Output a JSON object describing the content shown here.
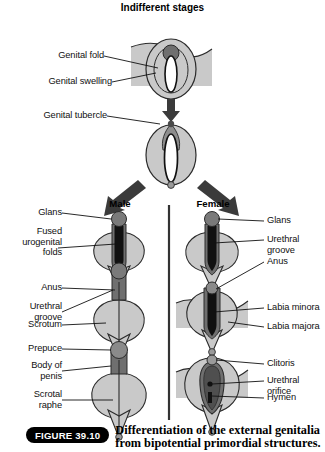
{
  "figure": {
    "title": "Indifferent\nstages",
    "badge": "FIGURE 39.10",
    "caption_line1": "Differentiation of the external genitalia",
    "caption_line2": "from bipotential primordial structures."
  },
  "columns": {
    "male_heading": "Male",
    "female_heading": "Female"
  },
  "indifferent_labels": [
    {
      "text": "Genital fold",
      "align": "right"
    },
    {
      "text": "Genital swelling",
      "align": "right"
    },
    {
      "text": "Genital tubercle",
      "align": "right"
    }
  ],
  "male_labels": [
    {
      "text": "Glans"
    },
    {
      "text": "Fused\nurogenital\nfolds"
    },
    {
      "text": "Anus"
    },
    {
      "text": "Urethral\ngroove"
    },
    {
      "text": "Scrotum"
    },
    {
      "text": "Prepuce"
    },
    {
      "text": "Body of\npenis"
    },
    {
      "text": "Scrotal\nraphe"
    }
  ],
  "female_labels": [
    {
      "text": "Glans"
    },
    {
      "text": "Urethral groove"
    },
    {
      "text": "Anus"
    },
    {
      "text": "Labia minora"
    },
    {
      "text": "Labia majora"
    },
    {
      "text": "Clitoris"
    },
    {
      "text": "Urethral orifice"
    },
    {
      "text": "Hymen"
    }
  ],
  "colors": {
    "light_gray": "#c9c9c9",
    "mid_gray": "#a8a8a8",
    "dark_gray": "#6f6f6f",
    "darker_gray": "#555555",
    "black": "#111111",
    "outline": "#2b2b2b",
    "white": "#ffffff",
    "arrow": "#3b3b3b"
  },
  "icon_names": {
    "arrow_down": "arrow-down-icon",
    "arrow_down_left": "arrow-down-left-icon",
    "arrow_down_right": "arrow-down-right-icon",
    "divider": "vertical-divider"
  }
}
